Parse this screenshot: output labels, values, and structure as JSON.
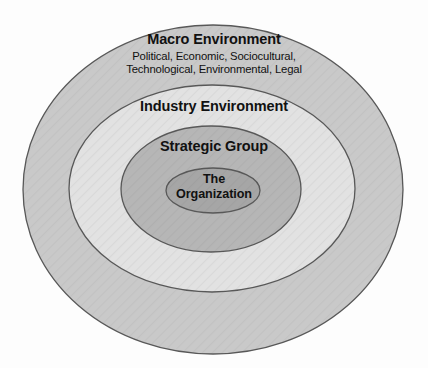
{
  "diagram": {
    "background_color": "#fdfdfd",
    "layers": [
      {
        "id": "macro",
        "name": "Macro Environment",
        "label": "Macro Environment",
        "description_line_1": "Political, Economic, Sociocultural,",
        "description_line_2": "Technological, Environmental, Legal",
        "fill_color": "#c9c9c9",
        "stroke_color": "#585858",
        "ellipse": {
          "cx": 213,
          "cy": 189.5,
          "rx": 190,
          "ry": 164.5
        }
      },
      {
        "id": "industry",
        "name": "Industry Environment",
        "label": "Industry Environment",
        "fill_color": "#e2e2e2",
        "stroke_color": "#585858",
        "ellipse": {
          "cx": 212,
          "cy": 188.5,
          "rx": 143,
          "ry": 103.5
        }
      },
      {
        "id": "strategic-group",
        "name": "Strategic Group",
        "label": "Strategic Group",
        "fill_color": "#b6b6b6",
        "stroke_color": "#585858",
        "ellipse": {
          "cx": 211,
          "cy": 189,
          "rx": 90,
          "ry": 63
        }
      },
      {
        "id": "organization",
        "name": "The Organization",
        "label_line_1": "The",
        "label_line_2": "Organization",
        "fill_color": "#a6a6a6",
        "stroke_color": "#585858",
        "ellipse": {
          "cx": 213,
          "cy": 190.5,
          "rx": 47,
          "ry": 22.5
        }
      }
    ]
  }
}
